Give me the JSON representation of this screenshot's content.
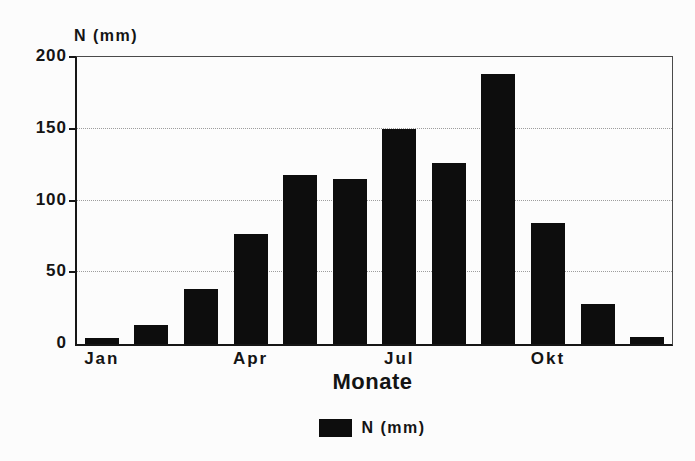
{
  "page": {
    "background": "#fcfcfc",
    "text_color": "#141414"
  },
  "chart_data": {
    "type": "bar",
    "title": "",
    "y_axis_title": "N (mm)",
    "xlabel": "Monate",
    "ylim": [
      0,
      200
    ],
    "y_ticks": [
      0,
      50,
      100,
      150,
      200
    ],
    "gridlines": [
      50,
      100,
      150
    ],
    "grid_style": "horizontal dotted",
    "n_bars": 12,
    "values": [
      4,
      13,
      38,
      77,
      118,
      115,
      150,
      126,
      188,
      84,
      28,
      5
    ],
    "x_tick_labels": [
      {
        "index": 0,
        "label": "Jan"
      },
      {
        "index": 3,
        "label": "Apr"
      },
      {
        "index": 6,
        "label": "Jul"
      },
      {
        "index": 9,
        "label": "Okt"
      }
    ],
    "bar_color": "#0d0d0d",
    "axis_color": "#161616",
    "legend_position": "bottom-center",
    "legend": [
      {
        "label": "N (mm)",
        "color": "#0d0d0d"
      }
    ]
  }
}
